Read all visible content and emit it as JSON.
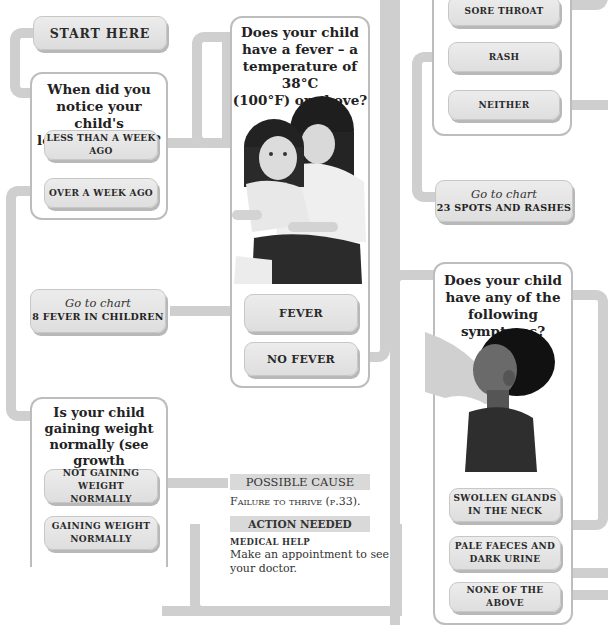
{
  "start": {
    "label": "Start here"
  },
  "q_appetite": {
    "title_lines": [
      "When did you",
      "notice your child's",
      "loss of appetite?"
    ],
    "options": [
      {
        "label": "Less than a week ago"
      },
      {
        "label": "Over a week ago"
      }
    ]
  },
  "q_fever": {
    "title_lines": [
      "Does your child",
      "have a fever – a",
      "temperature of 38°C",
      "(100°F) or above?"
    ],
    "image": "mother-holding-child-photo",
    "options": [
      {
        "label": "Fever"
      },
      {
        "label": "No fever"
      }
    ]
  },
  "goto_fever": {
    "prefix": "Go to chart",
    "target": "8 Fever in children"
  },
  "q_weight": {
    "title_lines": [
      "Is your child",
      "gaining weight",
      "normally (see growth",
      "charts, pp.17–20)?"
    ],
    "options": [
      {
        "label_lines": [
          "Not gaining weight",
          "normally"
        ]
      },
      {
        "label_lines": [
          "Gaining weight",
          "normally"
        ]
      }
    ]
  },
  "outcome": {
    "possible_cause_header": "Possible cause",
    "possible_cause_text": "Failure to thrive (p.33).",
    "action_header": "Action needed",
    "action_level": "medical help",
    "action_text_lines": [
      "Make an appointment to see",
      "your doctor."
    ]
  },
  "q_throat": {
    "options": [
      {
        "label": "Sore throat"
      },
      {
        "label": "Rash"
      },
      {
        "label": "Neither"
      }
    ]
  },
  "goto_spots": {
    "prefix": "Go to chart",
    "target": "23 Spots and rashes"
  },
  "q_symptoms": {
    "title_lines": [
      "Does your child",
      "have any of the",
      "following symptoms?"
    ],
    "image": "hand-checking-child-neck-photo",
    "options": [
      {
        "label_lines": [
          "Swollen glands",
          "in the neck"
        ]
      },
      {
        "label_lines": [
          "Pale faeces and",
          "dark urine"
        ]
      },
      {
        "label_lines": [
          "None of the above"
        ]
      }
    ]
  },
  "colors": {
    "connector": "#cfcfcf",
    "panel_border": "#bdbdbd",
    "button_bg": "#e4e4e4",
    "header_bar": "#d9d9d9"
  }
}
